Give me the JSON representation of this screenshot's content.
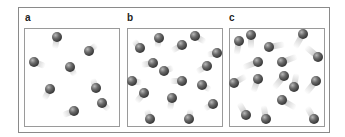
{
  "figure": {
    "panels": [
      {
        "label": "a",
        "molecule_count": 8,
        "molecules": [
          {
            "x": 57,
            "y": 37,
            "trail_angle": 100,
            "trail_len": 12
          },
          {
            "x": 89,
            "y": 51,
            "trail_angle": -40,
            "trail_len": 10
          },
          {
            "x": 34,
            "y": 62,
            "trail_angle": 20,
            "trail_len": 12
          },
          {
            "x": 70,
            "y": 67,
            "trail_angle": 60,
            "trail_len": 10
          },
          {
            "x": 50,
            "y": 89,
            "trail_angle": 120,
            "trail_len": 12
          },
          {
            "x": 96,
            "y": 88,
            "trail_angle": -110,
            "trail_len": 10
          },
          {
            "x": 102,
            "y": 103,
            "trail_angle": 45,
            "trail_len": 10
          },
          {
            "x": 74,
            "y": 111,
            "trail_angle": 160,
            "trail_len": 12
          }
        ]
      },
      {
        "label": "b",
        "molecule_count": 16,
        "molecules": [
          {
            "x": 140,
            "y": 48,
            "trail_angle": -130,
            "trail_len": 10
          },
          {
            "x": 159,
            "y": 38,
            "trail_angle": 100,
            "trail_len": 10
          },
          {
            "x": 182,
            "y": 45,
            "trail_angle": 150,
            "trail_len": 12
          },
          {
            "x": 195,
            "y": 36,
            "trail_angle": 30,
            "trail_len": 12
          },
          {
            "x": 217,
            "y": 53,
            "trail_angle": 170,
            "trail_len": 10
          },
          {
            "x": 153,
            "y": 63,
            "trail_angle": 170,
            "trail_len": 12
          },
          {
            "x": 164,
            "y": 71,
            "trail_angle": -20,
            "trail_len": 10
          },
          {
            "x": 207,
            "y": 66,
            "trail_angle": 150,
            "trail_len": 12
          },
          {
            "x": 132,
            "y": 81,
            "trail_angle": 10,
            "trail_len": 10
          },
          {
            "x": 182,
            "y": 81,
            "trail_angle": 180,
            "trail_len": 12
          },
          {
            "x": 202,
            "y": 85,
            "trail_angle": 30,
            "trail_len": 10
          },
          {
            "x": 144,
            "y": 93,
            "trail_angle": 130,
            "trail_len": 12
          },
          {
            "x": 172,
            "y": 98,
            "trail_angle": 100,
            "trail_len": 12
          },
          {
            "x": 213,
            "y": 104,
            "trail_angle": 150,
            "trail_len": 10
          },
          {
            "x": 150,
            "y": 119,
            "trail_angle": -110,
            "trail_len": 10
          },
          {
            "x": 189,
            "y": 119,
            "trail_angle": -80,
            "trail_len": 10
          }
        ]
      },
      {
        "label": "c",
        "molecule_count": 16,
        "molecules": [
          {
            "x": 239,
            "y": 41,
            "trail_angle": 100,
            "trail_len": 14
          },
          {
            "x": 251,
            "y": 35,
            "trail_angle": 90,
            "trail_len": 14
          },
          {
            "x": 303,
            "y": 34,
            "trail_angle": 120,
            "trail_len": 16
          },
          {
            "x": 269,
            "y": 47,
            "trail_angle": -10,
            "trail_len": 16
          },
          {
            "x": 318,
            "y": 57,
            "trail_angle": -140,
            "trail_len": 16
          },
          {
            "x": 258,
            "y": 62,
            "trail_angle": 160,
            "trail_len": 16
          },
          {
            "x": 282,
            "y": 62,
            "trail_angle": -20,
            "trail_len": 16
          },
          {
            "x": 234,
            "y": 83,
            "trail_angle": -30,
            "trail_len": 14
          },
          {
            "x": 258,
            "y": 79,
            "trail_angle": 110,
            "trail_len": 14
          },
          {
            "x": 284,
            "y": 76,
            "trail_angle": 130,
            "trail_len": 16
          },
          {
            "x": 294,
            "y": 87,
            "trail_angle": -80,
            "trail_len": 14
          },
          {
            "x": 316,
            "y": 81,
            "trail_angle": 130,
            "trail_len": 16
          },
          {
            "x": 282,
            "y": 100,
            "trail_angle": 30,
            "trail_len": 16
          },
          {
            "x": 246,
            "y": 115,
            "trail_angle": -120,
            "trail_len": 14
          },
          {
            "x": 266,
            "y": 119,
            "trail_angle": -100,
            "trail_len": 14
          },
          {
            "x": 314,
            "y": 119,
            "trail_angle": -120,
            "trail_len": 14
          }
        ]
      }
    ]
  },
  "colors": {
    "frame_border": "#8a8a8a",
    "box_border": "#9a9a9a",
    "molecule": "#3a3a3a",
    "trail": "#aaaaaa",
    "label": "#222222"
  }
}
